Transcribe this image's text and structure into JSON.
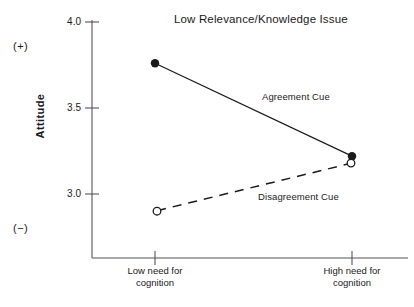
{
  "chart_data": {
    "type": "line",
    "title": "Low Relevance/Knowledge Issue",
    "xlabel": "",
    "ylabel": "Attitude",
    "categories": [
      "Low need for cognition",
      "High need for cognition"
    ],
    "category_lines": [
      [
        "Low need for",
        "cognition"
      ],
      [
        "High need for",
        "cognition"
      ]
    ],
    "yticks": [
      "4.0",
      "3.5",
      "3.0"
    ],
    "ytick_values": [
      4.0,
      3.5,
      3.0
    ],
    "ylim": [
      2.62,
      4.0
    ],
    "grid": false,
    "legend_position": "inline-annotation",
    "axis_endpoint_markers": {
      "positive": "(+)",
      "negative": "(−)"
    },
    "series": [
      {
        "name": "Agreement Cue",
        "values": [
          3.76,
          3.22
        ],
        "marker": "filled-circle",
        "line_style": "solid"
      },
      {
        "name": "Disagreement Cue",
        "values": [
          2.9,
          3.18
        ],
        "marker": "open-circle",
        "line_style": "dashed"
      }
    ]
  },
  "colors": {
    "ink": "#1a1a1a",
    "axis": "#555555",
    "background": "#ffffff"
  }
}
